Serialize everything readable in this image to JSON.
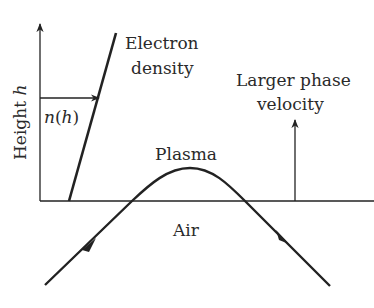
{
  "diagram": {
    "axis": {
      "y_label_prefix": "Height ",
      "y_label_var": "h"
    },
    "labels": {
      "electron_density_line1": "Electron",
      "electron_density_line2": "density",
      "n_of_h_fn": "n",
      "n_of_h_open": "(",
      "n_of_h_var": "h",
      "n_of_h_close": ")",
      "larger_phase_line1": "Larger phase",
      "larger_phase_line2": "velocity",
      "plasma": "Plasma",
      "air": "Air"
    },
    "colors": {
      "stroke": "#222222",
      "text": "#2a2a2a",
      "background": "#ffffff"
    }
  }
}
